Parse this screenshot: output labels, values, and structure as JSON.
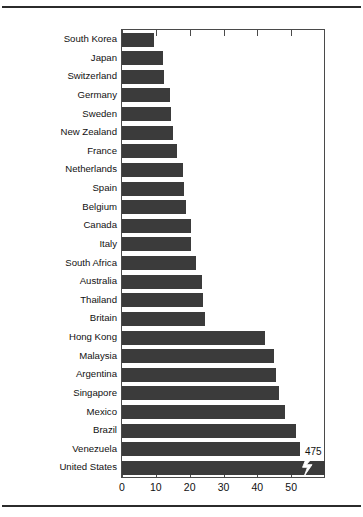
{
  "chart_data": {
    "type": "bar",
    "orientation": "horizontal",
    "title": "",
    "xlabel": "",
    "ylabel": "",
    "xlim": [
      0,
      60
    ],
    "xticks": [
      0,
      10,
      20,
      30,
      40,
      50
    ],
    "xticklabels": [
      "0",
      "10",
      "20",
      "30",
      "40",
      "50"
    ],
    "grid": false,
    "legend": null,
    "bar_color": "#3b3b3b",
    "frame_color": "#4a4a4a",
    "categories": [
      "South Korea",
      "Japan",
      "Switzerland",
      "Germany",
      "Sweden",
      "New Zealand",
      "France",
      "Netherlands",
      "Spain",
      "Belgium",
      "Canada",
      "Italy",
      "South Africa",
      "Australia",
      "Thailand",
      "Britain",
      "Hong Kong",
      "Malaysia",
      "Argentina",
      "Singapore",
      "Mexico",
      "Brazil",
      "Venezuela",
      "United States"
    ],
    "values": [
      9.5,
      12,
      12.3,
      14.3,
      14.5,
      15,
      16.3,
      18,
      18.3,
      19,
      20.3,
      20.5,
      22,
      23.5,
      23.8,
      24.5,
      42.3,
      45,
      45.4,
      46.5,
      48.3,
      51.5,
      52.5,
      60
    ],
    "annotations": [
      {
        "label": "475",
        "category": "United States",
        "note": "axis break: United States bar is truncated; true value 475"
      }
    ],
    "broken_bar": {
      "category": "United States",
      "marker": "zigzag-axis-break"
    }
  }
}
